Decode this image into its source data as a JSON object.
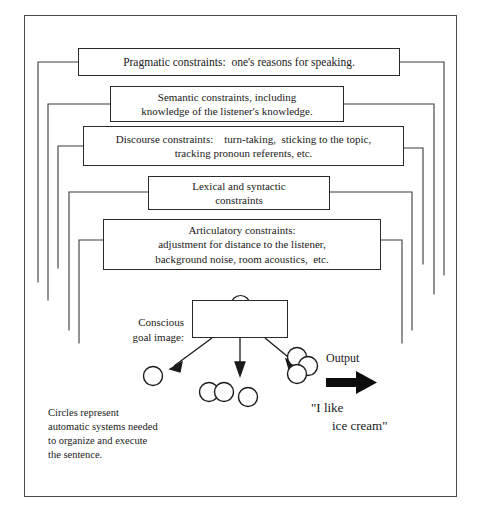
{
  "diagram": {
    "constraint_boxes": [
      {
        "name": "pragmatic",
        "lines": [
          "Pragmatic constraints:  one's reasons for speaking."
        ]
      },
      {
        "name": "semantic",
        "lines": [
          "Semantic constraints, including",
          "knowledge of the listener's knowledge."
        ]
      },
      {
        "name": "discourse",
        "lines": [
          "Discourse constraints:    turn-taking,  sticking to the topic,",
          "tracking pronoun referents, etc."
        ]
      },
      {
        "name": "lexical-syntactic",
        "lines": [
          "Lexical and syntactic",
          "constraints"
        ]
      },
      {
        "name": "articulatory",
        "lines": [
          "Articulatory constraints:",
          "adjustment for distance to the listener,",
          "background noise, room acoustics,  etc."
        ]
      }
    ],
    "goal_label": {
      "line1": "Conscious",
      "line2": "goal image:"
    },
    "goal_icon": "ice-cream-cone-icon",
    "output_label": "Output",
    "utterance": {
      "line1": "\"I like",
      "line2": "ice cream\""
    },
    "caption": [
      "Circles represent",
      "automatic systems needed",
      "to organize and execute",
      "the sentence."
    ],
    "circles": {
      "count": 9,
      "description": "Open circles representing automatic systems"
    },
    "colors": {
      "ink": "#1a1a1a",
      "box_border": "#2b2b2b",
      "frame_border": "#4a4a4a",
      "background": "#ffffff"
    }
  }
}
